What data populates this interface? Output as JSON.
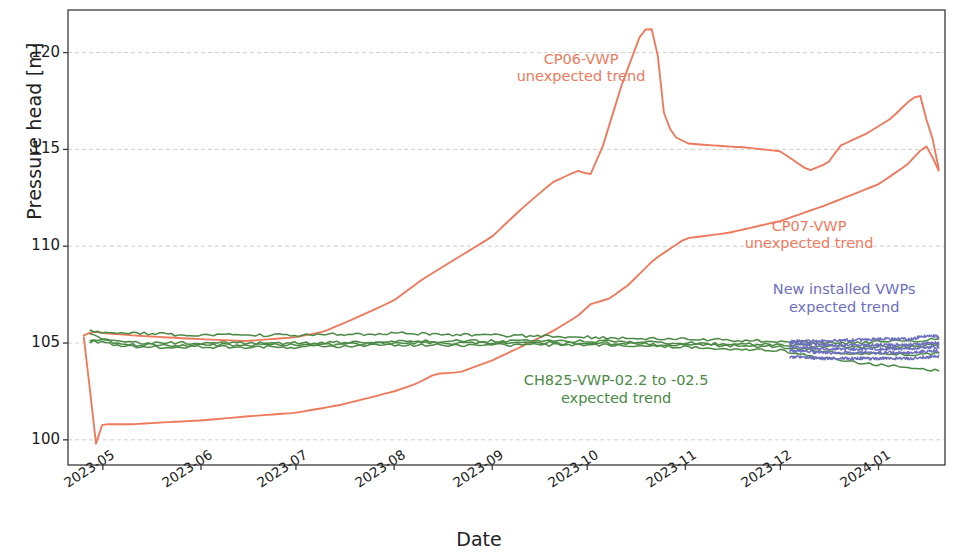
{
  "chart_data": {
    "type": "line",
    "title": "",
    "xlabel": "Date",
    "ylabel": "Pressure head [m]",
    "ylim": [
      98.7,
      122.2
    ],
    "xlim": [
      "2023-04-20",
      "2024-01-22"
    ],
    "grid": true,
    "grid_axis": "y",
    "legend_position": "none (inline annotations)",
    "yticks": [
      100,
      105,
      110,
      115,
      120
    ],
    "ytick_labels": [
      "100",
      "105",
      "110",
      "115",
      "120"
    ],
    "xticks": [
      "2023-05",
      "2023-06",
      "2023-07",
      "2023-08",
      "2023-09",
      "2023-10",
      "2023-11",
      "2023-12",
      "2024-01"
    ],
    "xtick_rotation_deg": -33,
    "colors": {
      "cp_vwp_orange": "#ee7a5e",
      "ch825_green": "#4a8a44",
      "new_vwp_purple": "#6e6fbe",
      "axis": "#3a3a3a",
      "grid": "#c9c9c9",
      "text": "#1a1a1a"
    },
    "annotations": [
      {
        "name": "cp06-annotation",
        "line1": "CP06-VWP",
        "line2": "unexpected trend",
        "color": "#ee7a5e",
        "x_frac": 0.585,
        "y_value": 119.2
      },
      {
        "name": "cp07-annotation",
        "line1": "CP07-VWP",
        "line2": "unexpected trend",
        "color": "#ee7a5e",
        "x_frac": 0.845,
        "y_value": 110.6
      },
      {
        "name": "new-vwp-annotation",
        "line1": "New installed VWPs",
        "line2": "expected trend",
        "color": "#6e6fbe",
        "x_frac": 0.885,
        "y_value": 107.3
      },
      {
        "name": "ch825-annotation",
        "line1": "CH825-VWP-02.2 to -02.5",
        "line2": "expected trend",
        "color": "#4a8a44",
        "x_frac": 0.625,
        "y_value": 102.6
      }
    ],
    "series": [
      {
        "name": "CP06-VWP",
        "color": "#ee7a5e",
        "label": "CP06-VWP unexpected trend",
        "x": [
          "2023-04-25",
          "2023-04-28",
          "2023-05-02",
          "2023-05-10",
          "2023-05-20",
          "2023-06-01",
          "2023-06-15",
          "2023-07-01",
          "2023-07-10",
          "2023-07-20",
          "2023-08-01",
          "2023-08-10",
          "2023-08-20",
          "2023-09-01",
          "2023-09-10",
          "2023-09-20",
          "2023-09-28",
          "2023-10-02",
          "2023-10-06",
          "2023-10-12",
          "2023-10-18",
          "2023-10-21",
          "2023-10-23",
          "2023-10-25",
          "2023-10-28",
          "2023-11-02",
          "2023-11-10",
          "2023-11-20",
          "2023-12-01",
          "2023-12-10",
          "2023-12-16",
          "2023-12-20",
          "2023-12-28",
          "2024-01-05",
          "2024-01-10",
          "2024-01-14",
          "2024-01-16",
          "2024-01-18",
          "2024-01-20"
        ],
        "y": [
          105.4,
          105.6,
          105.5,
          105.4,
          105.3,
          105.2,
          105.1,
          105.3,
          105.6,
          106.3,
          107.2,
          108.3,
          109.3,
          110.5,
          111.9,
          113.3,
          113.9,
          113.7,
          115.2,
          118.4,
          121.0,
          121.4,
          120.3,
          117.0,
          115.7,
          115.3,
          115.2,
          115.1,
          114.9,
          113.9,
          114.3,
          115.2,
          115.8,
          116.6,
          117.4,
          117.9,
          116.6,
          115.6,
          114.0
        ]
      },
      {
        "name": "CP07-VWP",
        "color": "#ee7a5e",
        "label": "CP07-VWP unexpected trend",
        "x": [
          "2023-04-25",
          "2023-04-27",
          "2023-04-29",
          "2023-05-01",
          "2023-05-03",
          "2023-05-10",
          "2023-05-20",
          "2023-06-01",
          "2023-06-15",
          "2023-07-01",
          "2023-07-15",
          "2023-08-01",
          "2023-08-08",
          "2023-08-14",
          "2023-08-22",
          "2023-09-01",
          "2023-09-10",
          "2023-09-20",
          "2023-09-28",
          "2023-10-02",
          "2023-10-08",
          "2023-10-14",
          "2023-10-22",
          "2023-11-01",
          "2023-11-15",
          "2023-12-01",
          "2023-12-15",
          "2024-01-01",
          "2024-01-10",
          "2024-01-14",
          "2024-01-16",
          "2024-01-18",
          "2024-01-20"
        ],
        "y": [
          105.3,
          102.5,
          99.6,
          100.9,
          100.8,
          100.8,
          100.9,
          101.0,
          101.2,
          101.4,
          101.8,
          102.5,
          102.9,
          103.4,
          103.5,
          104.1,
          104.8,
          105.6,
          106.4,
          107.0,
          107.3,
          108.0,
          109.3,
          110.4,
          110.7,
          111.3,
          112.1,
          113.2,
          114.2,
          114.9,
          115.2,
          114.6,
          113.9
        ]
      },
      {
        "name": "CH825-VWP-02.2",
        "color": "#4a8a44",
        "label": "CH825-VWP-02.2 to -02.5 expected trend",
        "x": [
          "2023-04-27",
          "2023-05-10",
          "2023-06-01",
          "2023-07-01",
          "2023-08-01",
          "2023-09-01",
          "2023-10-01",
          "2023-11-01",
          "2023-12-01",
          "2023-12-20",
          "2024-01-10",
          "2024-01-20"
        ],
        "y": [
          105.6,
          105.5,
          105.4,
          105.4,
          105.5,
          105.4,
          105.3,
          105.2,
          105.1,
          105.0,
          105.1,
          105.2
        ]
      },
      {
        "name": "CH825-VWP-02.3",
        "color": "#4a8a44",
        "x": [
          "2023-04-27",
          "2023-05-10",
          "2023-06-01",
          "2023-07-01",
          "2023-08-01",
          "2023-09-01",
          "2023-10-01",
          "2023-11-01",
          "2023-12-01",
          "2023-12-20",
          "2024-01-10",
          "2024-01-20"
        ],
        "y": [
          105.4,
          105.0,
          105.0,
          105.0,
          105.1,
          105.1,
          105.1,
          105.0,
          104.9,
          104.8,
          104.8,
          104.9
        ]
      },
      {
        "name": "CH825-VWP-02.4",
        "color": "#4a8a44",
        "x": [
          "2023-04-27",
          "2023-05-10",
          "2023-06-01",
          "2023-07-01",
          "2023-08-01",
          "2023-09-01",
          "2023-10-01",
          "2023-11-01",
          "2023-12-01",
          "2023-12-20",
          "2024-01-10",
          "2024-01-20"
        ],
        "y": [
          105.2,
          104.9,
          104.9,
          104.9,
          105.0,
          105.0,
          105.0,
          104.9,
          104.8,
          104.5,
          104.4,
          104.5
        ]
      },
      {
        "name": "CH825-VWP-02.5",
        "color": "#4a8a44",
        "x": [
          "2023-04-27",
          "2023-05-10",
          "2023-06-01",
          "2023-07-01",
          "2023-08-01",
          "2023-09-01",
          "2023-10-01",
          "2023-11-01",
          "2023-12-01",
          "2023-12-20",
          "2024-01-10",
          "2024-01-20"
        ],
        "y": [
          105.1,
          104.8,
          104.8,
          104.8,
          104.9,
          104.9,
          104.9,
          104.8,
          104.6,
          104.1,
          103.7,
          103.6
        ]
      },
      {
        "name": "New VWP 1",
        "color": "#6e6fbe",
        "label": "New installed VWPs expected trend",
        "x": [
          "2023-12-04",
          "2023-12-15",
          "2024-01-01",
          "2024-01-10",
          "2024-01-18",
          "2024-01-20"
        ],
        "y": [
          105.1,
          105.1,
          105.2,
          105.2,
          105.4,
          105.3
        ]
      },
      {
        "name": "New VWP 2",
        "color": "#6e6fbe",
        "x": [
          "2023-12-04",
          "2023-12-15",
          "2024-01-01",
          "2024-01-10",
          "2024-01-18",
          "2024-01-20"
        ],
        "y": [
          105.0,
          104.9,
          104.9,
          104.9,
          105.0,
          105.0
        ]
      },
      {
        "name": "New VWP 3",
        "color": "#6e6fbe",
        "x": [
          "2023-12-04",
          "2023-12-15",
          "2024-01-01",
          "2024-01-10",
          "2024-01-18",
          "2024-01-20"
        ],
        "y": [
          104.8,
          104.7,
          104.7,
          104.7,
          104.8,
          104.8
        ]
      },
      {
        "name": "New VWP 4",
        "color": "#6e6fbe",
        "x": [
          "2023-12-04",
          "2023-12-15",
          "2024-01-01",
          "2024-01-10",
          "2024-01-18",
          "2024-01-20"
        ],
        "y": [
          104.6,
          104.5,
          104.5,
          104.5,
          104.6,
          104.6
        ]
      },
      {
        "name": "New VWP 5",
        "color": "#6e6fbe",
        "x": [
          "2023-12-04",
          "2023-12-15",
          "2024-01-01",
          "2024-01-10",
          "2024-01-18",
          "2024-01-20"
        ],
        "y": [
          104.3,
          104.2,
          104.2,
          104.2,
          104.3,
          104.3
        ]
      }
    ]
  },
  "axis": {
    "ylabel": "Pressure head [m]",
    "xlabel": "Date"
  }
}
